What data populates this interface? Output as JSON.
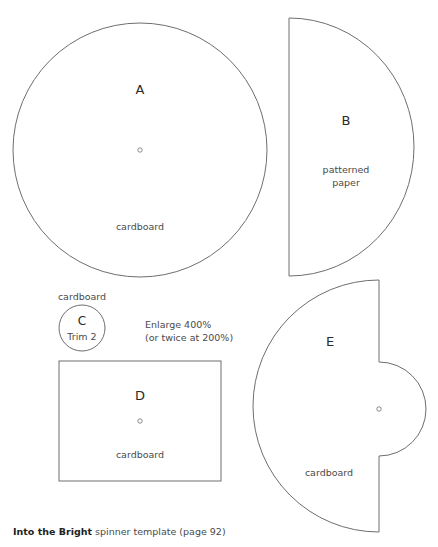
{
  "pieces": {
    "A": {
      "letter": "A",
      "material": "cardboard"
    },
    "B": {
      "letter": "B",
      "material_line1": "patterned",
      "material_line2": "paper"
    },
    "C": {
      "material": "cardboard",
      "letter": "C",
      "note": "Trim 2"
    },
    "D": {
      "letter": "D",
      "material": "cardboard"
    },
    "E": {
      "letter": "E",
      "material": "cardboard"
    }
  },
  "enlarge_note": {
    "line1": "Enlarge 400%",
    "line2": "(or twice at 200%)"
  },
  "caption": {
    "title": "Into the Bright",
    "rest": " spinner template (page 92)"
  },
  "colors": {
    "stroke": "#6e6e6e",
    "text": "#4a4a4a"
  }
}
